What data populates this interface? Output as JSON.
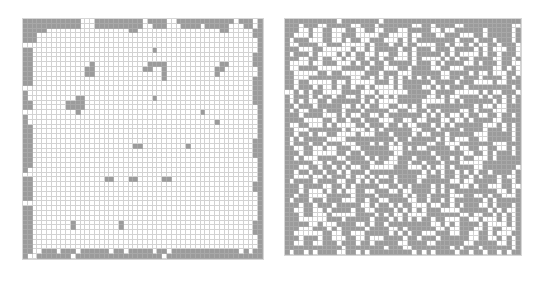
{
  "colors": {
    "filled": "#9b9b9b",
    "empty": "#ffffff",
    "gridline": "#d2d2d2"
  },
  "grids": [
    {
      "name": "left-grid",
      "label": "",
      "x": 22,
      "y": 18,
      "size": 240,
      "rows": 50,
      "cols": 50,
      "cells": [
        "11111111111100011111111110111100111111111111011101",
        "11111111111100011111111110011100011110111110001101",
        "11111000000000000000001100000000000000000110000011",
        "11100000000000000000000000000000000000000000000011",
        "11100000000000000000000000000000000000000000000001",
        "00000000000000000000000000000000000000000000000001",
        "11000000000000000000000000010000000000000000000001",
        "11000000000000000000000000000000000000000000000011",
        "11000000000000000000000000000000000000000000000011",
        "11000000000000100000000000111100000000000110000011",
        "11000000000001100000000001100100000000001100000001",
        "11000000000001100000000000000100000000001000000001",
        "11000000000000000000000000000100000000000000000011",
        "11000000000000000000000000000000000000000000000011",
        "00000000000000000000000000000000000000000000000011",
        "10000000000000000000000000000000000000000000000011",
        "10000000000110000000000000010000000000000000000011",
        "11000000011110000000000000000000000000000000000011",
        "11000000011110000000000000000000000000000000000001",
        "00000000000100000000000000000000000001000000000001",
        "10000000000000000000000000000000000000000000000001",
        "10000000000000000000000000000000000000001000000001",
        "11000000000000000000000000000000000000000000000001",
        "11000000000000000000000000000000000000000000000001",
        "11000000000000000000000000000000000000000000000001",
        "11000000000000000000000000000000000000000000000011",
        "11000000000000000000000110000000001000000000000011",
        "11000000000000000000000000000000000000000000000011",
        "11000000000000000000000000000000000000000000000011",
        "11000000000000000000000000000000000000000000000001",
        "11000000000000000000000000000000000000000000000001",
        "10000000000000000000000000000000000000000000000001",
        "00000000000000000000000000000000000000000000000001",
        "11000000000000000110001100000110000000000000000001",
        "11000000000000000000000000000000000000000000000011",
        "11000000000000000000000000000000000000000000000011",
        "11000000000000000000000000000000000000000000000001",
        "11000000000000000000000000000000000000000000000001",
        "00000000000000000000000000000000000000000000000001",
        "11000000000000000000000000000000000000000000000001",
        "11000000000000000000000000000000000000000000000001",
        "11000000000000000000000000000000000000000000000001",
        "11000000001000000000100000000000000000000000000011",
        "11000000001000000000100000000000000000000000000011",
        "11000000000000000000000000000000000000000000000011",
        "11000000000000000000000000000000000000000000000001",
        "11000000000000000000000000000000000000000000000001",
        "11000000000000000000000000000000000000000000000001",
        "11001110111011111101101111101101111111111111101011",
        "10011111110111111111111111111011111111111111111111"
      ]
    },
    {
      "name": "right-grid",
      "label": "",
      "x": 284,
      "y": 18,
      "size": 236,
      "rows": 50,
      "cols": 50,
      "cells": [
        "11111111111011111111011111111111111111111111111111",
        "11101110011111001110111111100110111100111111111100",
        "11100100110001100110011100111110010011111101111101",
        "11000100110011100000110000100111001110001101111101",
        "10111000110010110011100010101111111101110111011101",
        "10011110011100000101110110110000110100101001101110",
        "11100011000000100101111101101110111011110101000110",
        "10111010000101011001001100101111101010000101101110",
        "11100110110010011011011000101000010101101111001101",
        "10000100111000101101101111101110101111001011101100",
        "10011110000011111011100011011110011000111111001010",
        "11000001101100000111011100011111100111101001000110",
        "11000111111111001101010101010101100110111011110101",
        "11011000001001000001110101111110111101110000100111",
        "11011101001011011010000101111001010111011111111101",
        "00101011000011110001000000111110111100000101001110",
        "10111010110110010110101011111100101001111010110101",
        "10101001101111110101000011111000001010111111010101",
        "11011101111100101011001100101011111111110100100111",
        "10100111011101110111110011001101011110010111000111",
        "11101111000101001100101111111010101001011001101101",
        "11110000110110110111000110010011100100101111001111",
        "10011000101000011011101101001110101011111100010101",
        "11000111111101000101011111100111011110111101110101",
        "11011010011000010001110111101001110111110001111101",
        "10101111100001111111111011011111010100011001111101",
        "10111011011100011101010101111100110001111111000111",
        "11001100100111001111110001010011111010011001100101",
        "11101100000110110111111001111110111111001101011101",
        "11010001111001111010110011101111011010110001011111",
        "11111100101110111101100011011011101110000011111111",
        "11100110110101001100000111000101001011110011111110",
        "11011011011010111011111111111010101101010110111101",
        "11000100101110100101001011110011101101101011101001",
        "10111101111001101010111011110111111001001111101101",
        "11101111001101011111001101011110101110010110001100",
        "11101000101010011001110010011110101011111111100101",
        "11011000011111011110111110101101111000110010110001",
        "10111011011100011011001111001101101011111101011111",
        "11101101110111110010110101100010011010111001011101",
        "11001100101111011001111010101011100001111110101001",
        "11101100010000011110101001000011111110010011010101",
        "11100000011101111101110101010110110001100100010101",
        "11111001000111100101101111111110010101111010000101",
        "11100011101011111011110010111111001001110010110001",
        "11000000110011000111110101011000111001100110100011",
        "11101110110001100100011110110111011111100110010101",
        "11001100111011101101111100111100111111001111100101",
        "11111111111101111111101110011111111010111011111101",
        "10110101111001101011111111101010111101101101101011"
      ]
    }
  ]
}
